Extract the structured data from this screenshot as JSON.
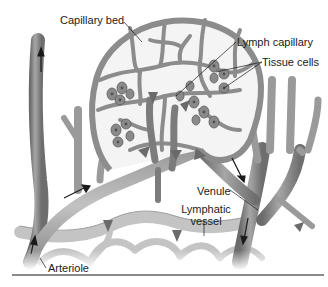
{
  "figure": {
    "type": "anatomical illustration",
    "colors": {
      "vessel_fill": "#8c8c8c",
      "vessel_highlight": "#b8b8b8",
      "vessel_shadow": "#5e5e5e",
      "tissue_cell": "#7a7a7a",
      "cell_nucleus": "#555555",
      "arrow": "#222222",
      "flow_arrow": "#6a6a6a",
      "background": "#ffffff",
      "rule": "#8a8a8a"
    }
  },
  "labels": {
    "capillary_bed": "Capillary bed",
    "lymph_capillary": "Lymph capillary",
    "tissue_cells": "Tissue cells",
    "venule": "Venule",
    "lymphatic_vessel_line1": "Lymphatic",
    "lymphatic_vessel_line2": "vessel",
    "arteriole": "Arteriole"
  }
}
